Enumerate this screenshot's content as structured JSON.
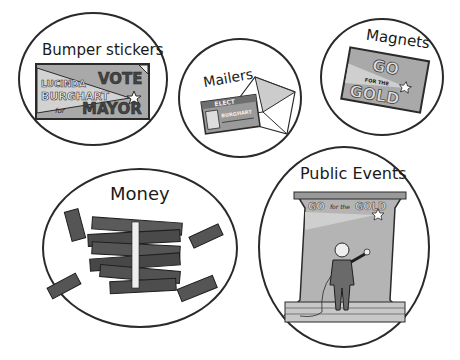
{
  "illustration": {
    "topic": "Campaign advertising methods",
    "panels": [
      {
        "id": "bumper-stickers",
        "title": "Bumper stickers",
        "sticker": {
          "line1": "LUCINDA",
          "line2": "BURGHART",
          "line3": "for",
          "line4": "VOTE",
          "line5": "MAYOR"
        }
      },
      {
        "id": "mailers",
        "title": "Mailers",
        "mailer": {
          "header": "ELECT",
          "name": "BURGHART"
        }
      },
      {
        "id": "magnets",
        "title": "Magnets",
        "magnet": {
          "line1": "GO",
          "line2": "FOR THE",
          "line3": "GOLD"
        }
      },
      {
        "id": "money",
        "title": "Money"
      },
      {
        "id": "public-events",
        "title": "Public Events",
        "banner": {
          "go": "GO",
          "for_the": "for the",
          "gold": "GOLD"
        }
      }
    ]
  },
  "colors": {
    "outline": "#2a2a2a",
    "sticker_gray": "#a9a9a9",
    "sticker_light": "#cfcfcf",
    "money_dark": "#4a4a4a",
    "background": "#ffffff"
  }
}
